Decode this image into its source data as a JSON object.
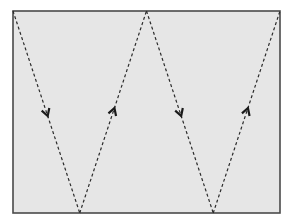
{
  "diagram": {
    "colors": {
      "frame_fill": "#e6e6e6",
      "frame_stroke": "#4a4a4a",
      "path_stroke": "#2b2b2b",
      "arrow": "#1a1a1a",
      "background": "#ffffff"
    },
    "path": {
      "style": "dashed",
      "vertices": [
        "top-left-corner",
        "bottom",
        "top-middle",
        "bottom",
        "top-right-corner"
      ],
      "segments": [
        {
          "id": 1,
          "direction": "down",
          "arrow": "down-arrow-icon"
        },
        {
          "id": 2,
          "direction": "up",
          "arrow": "up-arrow-icon"
        },
        {
          "id": 3,
          "direction": "down",
          "arrow": "down-arrow-icon"
        },
        {
          "id": 4,
          "direction": "up",
          "arrow": "up-arrow-icon"
        }
      ]
    }
  }
}
